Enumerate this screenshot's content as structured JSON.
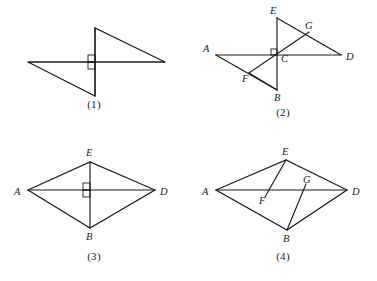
{
  "page": {
    "width": 377,
    "height": 281,
    "background": "#ffffff",
    "ink_color": "#1a1a1a"
  },
  "figures": [
    {
      "id": "figure-1",
      "caption": "(1)",
      "type": "pinwheel-two-right-triangles",
      "labels": [],
      "angle_marks": 2,
      "note": "Two congruent right triangles joined at a common crossing point; two small right-angle squares mark the perpendicular crossing."
    },
    {
      "id": "figure-2",
      "caption": "(2)",
      "type": "pinwheel-labeled",
      "labels": [
        "A",
        "B",
        "C",
        "D",
        "E",
        "F",
        "G"
      ],
      "angle_marks": 1,
      "note": "Pinwheel of two right triangles crossing at C; E and B are the vertical extremes, A and D the horizontal extremes, F and G are secondary intersection points."
    },
    {
      "id": "figure-3",
      "caption": "(3)",
      "type": "rhombus-with-diagonals",
      "labels": [
        "A",
        "B",
        "D",
        "E"
      ],
      "angle_marks": 2,
      "note": "Rhombus A-E-D-B with both diagonals AD and EB drawn; the diagonals meet at right angles, marked by two small squares."
    },
    {
      "id": "figure-4",
      "caption": "(4)",
      "type": "rhombus-with-cevians",
      "labels": [
        "A",
        "B",
        "D",
        "E",
        "F",
        "G"
      ],
      "angle_marks": 0,
      "note": "Rhombus A-E-D-B with diagonal AD drawn; segment from E meets AD at F and segment from B meets AD at G."
    }
  ],
  "figure1": {
    "caption": "(1)"
  },
  "figure2": {
    "caption": "(2)",
    "labels": {
      "A": "A",
      "B": "B",
      "C": "C",
      "D": "D",
      "E": "E",
      "F": "F",
      "G": "G"
    }
  },
  "figure3": {
    "caption": "(3)",
    "labels": {
      "A": "A",
      "B": "B",
      "D": "D",
      "E": "E"
    }
  },
  "figure4": {
    "caption": "(4)",
    "labels": {
      "A": "A",
      "B": "B",
      "D": "D",
      "E": "E",
      "F": "F",
      "G": "G"
    }
  }
}
